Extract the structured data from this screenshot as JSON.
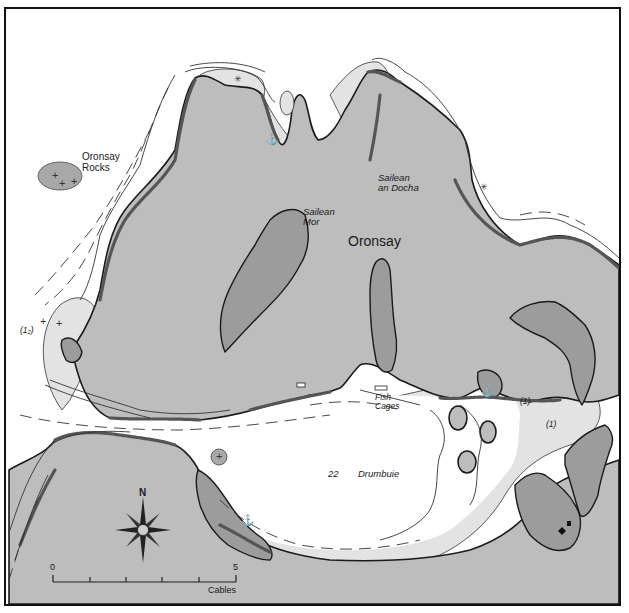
{
  "map": {
    "type": "nautical pilotage chart",
    "title": "Oronsay",
    "colors": {
      "land": "#bdbdbd",
      "drying_foreshore": "#9c9c9c",
      "shallow_water": "#e3e3e3",
      "deep_water": "#ffffff",
      "coastline": "#1a1a1a"
    },
    "labels": {
      "island": "Oronsay",
      "oronsay_rocks_line1": "Oronsay",
      "oronsay_rocks_line2": "Rocks",
      "sailean_mor_line1": "Sailean",
      "sailean_mor_line2": "Mor",
      "sailean_an_docha_line1": "Sailean",
      "sailean_an_docha_line2": "an Docha",
      "fish_cages_line1": "Fish",
      "fish_cages_line2": "Cages",
      "drumbuie": "Drumbuie",
      "depth_22": "22",
      "drying_height_west": "(1₂)",
      "drying_height_east_1": "(1)",
      "drying_height_east_2": "(1)"
    },
    "compass": {
      "north_label": "N"
    },
    "scale_bar": {
      "start_label": "0",
      "end_label": "5",
      "unit_label": "Cables",
      "divisions": 5
    },
    "symbols": {
      "anchorage": "⚓",
      "rock_awash": "+",
      "wreck_star": "✳"
    }
  }
}
